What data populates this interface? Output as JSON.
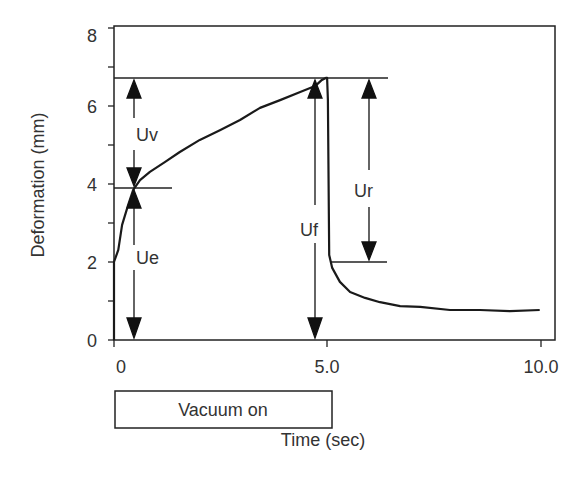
{
  "chart_data": {
    "type": "line",
    "title": "",
    "xlabel": "Time (sec)",
    "ylabel": "Deformation (mm)",
    "xlim": [
      0,
      10.6
    ],
    "ylim": [
      0,
      8
    ],
    "x_ticks": [
      0,
      5.0,
      10.0
    ],
    "x_tick_labels": [
      "0",
      "5.0",
      "10.0"
    ],
    "y_ticks": [
      0,
      2,
      4,
      6,
      8
    ],
    "y_tick_labels": [
      "0",
      "2",
      "4",
      "6",
      "8"
    ],
    "y_minor_ticks": [
      1,
      3,
      5,
      7
    ],
    "grid": false,
    "legend": null,
    "series": [
      {
        "name": "Deformation",
        "x": [
          0,
          0.0,
          0.1,
          0.19,
          0.33,
          0.45,
          0.61,
          0.84,
          1.19,
          1.54,
          2.01,
          2.48,
          2.95,
          3.42,
          3.89,
          4.36,
          4.71,
          4.87,
          4.96,
          4.99,
          5.01,
          5.04,
          5.11,
          5.29,
          5.53,
          5.88,
          6.23,
          6.7,
          7.17,
          7.87,
          8.57,
          9.27,
          9.97
        ],
        "values": [
          0,
          2.0,
          2.31,
          2.95,
          3.46,
          3.85,
          4.1,
          4.31,
          4.56,
          4.82,
          5.13,
          5.38,
          5.64,
          5.95,
          6.15,
          6.36,
          6.51,
          6.67,
          6.72,
          6.72,
          6.15,
          2.18,
          1.85,
          1.49,
          1.23,
          1.08,
          0.97,
          0.87,
          0.85,
          0.77,
          0.77,
          0.74,
          0.77
        ]
      }
    ],
    "reference_lines": [
      {
        "name": "max-deformation-line",
        "y": 6.72,
        "x_from": 0,
        "x_to": 6.4
      },
      {
        "name": "elastic-deformation-line",
        "y": 3.9,
        "x_from": 0,
        "x_to": 1.36
      },
      {
        "name": "residual-line",
        "y": 2.0,
        "x_from": 5.06,
        "x_to": 6.4
      }
    ],
    "annotations": [
      {
        "label": "Uv",
        "x": 0.45,
        "y_from": 3.9,
        "y_to": 6.72,
        "type": "double-arrow-outward"
      },
      {
        "label": "Ue",
        "x": 0.45,
        "y_from": 0,
        "y_to": 3.9,
        "type": "double-arrow-outward"
      },
      {
        "label": "Uf",
        "x": 4.78,
        "y_from": 0,
        "y_to": 6.72,
        "type": "double-arrow-outward"
      },
      {
        "label": "Ur",
        "x": 5.97,
        "y_from": 2.0,
        "y_to": 6.72,
        "type": "double-arrow-outward"
      }
    ],
    "phase_box": {
      "label": "Vacuum on",
      "x_from": 0,
      "x_to": 5.0
    }
  },
  "labels": {
    "ylabel": "Deformation (mm)",
    "xlabel": "Time (sec)",
    "vacuum": "Vacuum on",
    "uv": "Uv",
    "ue": "Ue",
    "uf": "Uf",
    "ur": "Ur",
    "xticks": [
      "0",
      "5.0",
      "10.0"
    ],
    "yticks": [
      "0",
      "2",
      "4",
      "6",
      "8"
    ]
  },
  "colors": {
    "line": "#1a1a1a",
    "text": "#333333",
    "background": "#ffffff"
  }
}
